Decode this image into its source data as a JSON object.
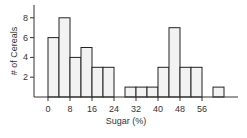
{
  "chart_data": {
    "type": "bar",
    "subtype": "histogram",
    "title": "",
    "xlabel": "Sugar (%)",
    "ylabel": "# of Cereals",
    "bin_width": 4,
    "bins": [
      {
        "start": 0,
        "end": 4,
        "count": 6
      },
      {
        "start": 4,
        "end": 8,
        "count": 8
      },
      {
        "start": 8,
        "end": 12,
        "count": 4
      },
      {
        "start": 12,
        "end": 16,
        "count": 5
      },
      {
        "start": 16,
        "end": 20,
        "count": 3
      },
      {
        "start": 20,
        "end": 24,
        "count": 3
      },
      {
        "start": 24,
        "end": 28,
        "count": 0
      },
      {
        "start": 28,
        "end": 32,
        "count": 1
      },
      {
        "start": 32,
        "end": 36,
        "count": 1
      },
      {
        "start": 36,
        "end": 40,
        "count": 1
      },
      {
        "start": 40,
        "end": 44,
        "count": 3
      },
      {
        "start": 44,
        "end": 48,
        "count": 7
      },
      {
        "start": 48,
        "end": 52,
        "count": 3
      },
      {
        "start": 52,
        "end": 56,
        "count": 3
      },
      {
        "start": 56,
        "end": 60,
        "count": 0
      },
      {
        "start": 60,
        "end": 64,
        "count": 1
      }
    ],
    "categories": [
      "0-4",
      "4-8",
      "8-12",
      "12-16",
      "16-20",
      "20-24",
      "24-28",
      "28-32",
      "32-36",
      "36-40",
      "40-44",
      "44-48",
      "48-52",
      "52-56",
      "56-60",
      "60-64"
    ],
    "values": [
      6,
      8,
      4,
      5,
      3,
      3,
      0,
      1,
      1,
      1,
      3,
      7,
      3,
      3,
      0,
      1
    ],
    "x_ticks": [
      0,
      8,
      16,
      24,
      32,
      40,
      48,
      56
    ],
    "y_ticks": [
      2,
      4,
      6,
      8
    ],
    "xlim": [
      -5,
      70
    ],
    "ylim": [
      0,
      9
    ],
    "grid": false,
    "legend": null,
    "colors": {
      "bar_fill": "#f2f2f2",
      "bar_stroke": "#222222",
      "axis": "#333333"
    }
  }
}
